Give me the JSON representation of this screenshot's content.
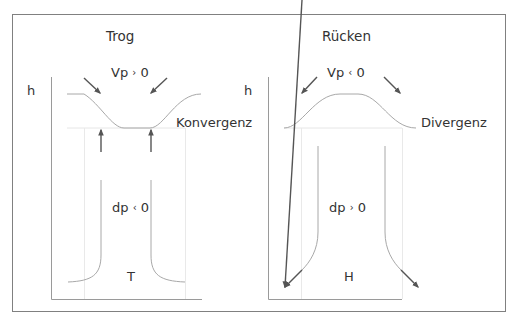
{
  "colors": {
    "frame": "#808080",
    "axis": "#9a9a9a",
    "guide": "#e6e6e6",
    "curve": "#a8a8a8",
    "arrow": "#555555",
    "text": "#333333"
  },
  "panels": [
    {
      "id": "trough",
      "title": "Trog",
      "axis_label": "h",
      "top_var": "Vp",
      "top_cmp": "›",
      "top_val": "0",
      "side_label": "Konvergenz",
      "mid_var": "dp",
      "mid_cmp": "‹",
      "mid_val": "0",
      "center_label": "T"
    },
    {
      "id": "ridge",
      "title": "Rücken",
      "axis_label": "h",
      "top_var": "Vp",
      "top_cmp": "‹",
      "top_val": "0",
      "side_label": "Divergenz",
      "mid_var": "dp",
      "mid_cmp": "›",
      "mid_val": "0",
      "center_label": "H"
    }
  ]
}
